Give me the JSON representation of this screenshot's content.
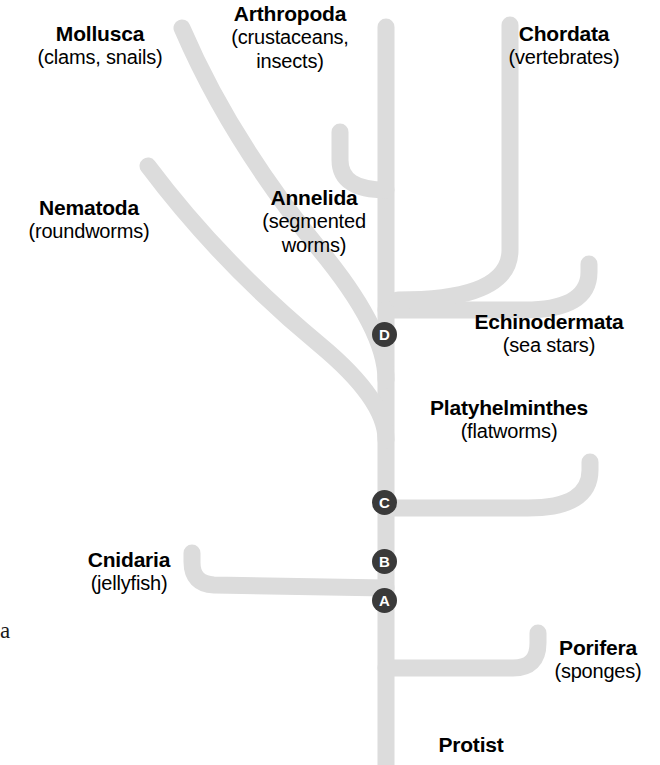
{
  "diagram": {
    "type": "phylogenetic-tree",
    "branch_color": "#dcdcdc",
    "node_color": "#3a3a3a",
    "node_text_color": "#ffffff",
    "background": "#ffffff"
  },
  "taxa": [
    {
      "id": "mollusca",
      "name": "Mollusca",
      "common": "(clams, snails)"
    },
    {
      "id": "arthropoda",
      "name": "Arthropoda",
      "common": "(crustaceans,",
      "common2": "insects)"
    },
    {
      "id": "chordata",
      "name": "Chordata",
      "common": "(vertebrates)"
    },
    {
      "id": "nematoda",
      "name": "Nematoda",
      "common": "(roundworms)"
    },
    {
      "id": "annelida",
      "name": "Annelida",
      "common": "(segmented",
      "common2": "worms)"
    },
    {
      "id": "echinodermata",
      "name": "Echinodermata",
      "common": "(sea stars)"
    },
    {
      "id": "platyhelminthes",
      "name": "Platyhelminthes",
      "common": "(flatworms)"
    },
    {
      "id": "cnidaria",
      "name": "Cnidaria",
      "common": "(jellyfish)"
    },
    {
      "id": "porifera",
      "name": "Porifera",
      "common": "(sponges)"
    },
    {
      "id": "protist",
      "name": "Protist",
      "common": ""
    }
  ],
  "nodes": [
    {
      "id": "node-a",
      "label": "A"
    },
    {
      "id": "node-b",
      "label": "B"
    },
    {
      "id": "node-c",
      "label": "C"
    },
    {
      "id": "node-d",
      "label": "D"
    }
  ],
  "fragments": {
    "left_edge_char": "a"
  }
}
